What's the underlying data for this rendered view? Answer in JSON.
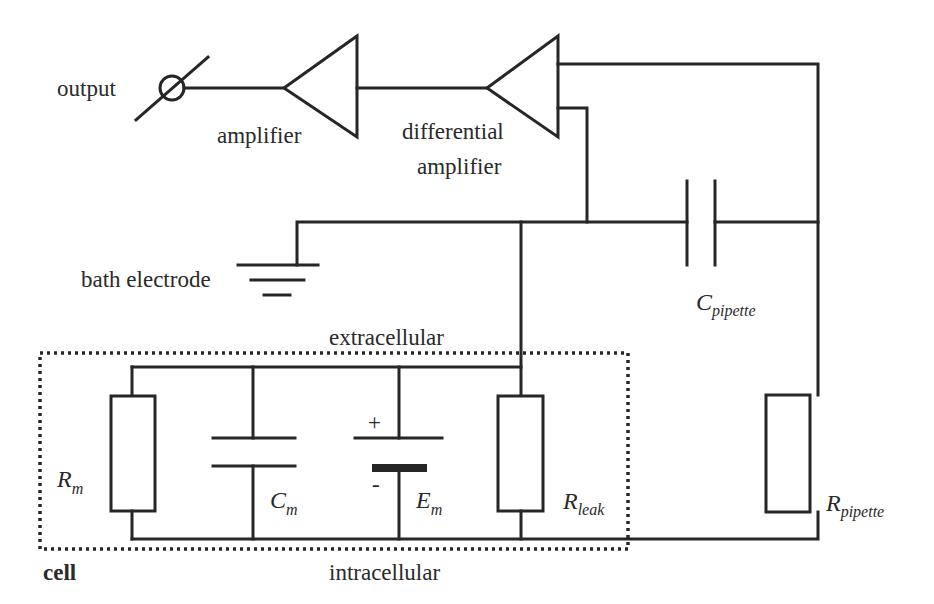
{
  "diagram": {
    "labels": {
      "output": "output",
      "amplifier": "amplifier",
      "differential_amplifier_line1": "differential",
      "differential_amplifier_line2": "amplifier",
      "bath_electrode": "bath electrode",
      "extracellular": "extracellular",
      "intracellular": "intracellular",
      "cell": "cell",
      "plus_sign": "+",
      "minus_sign": "-"
    },
    "components": {
      "c_pipette": {
        "symbol": "C",
        "subscript": "pipette"
      },
      "r_pipette": {
        "symbol": "R",
        "subscript": "pipette"
      },
      "r_m": {
        "symbol": "R",
        "subscript": "m"
      },
      "c_m": {
        "symbol": "C",
        "subscript": "m"
      },
      "e_m": {
        "symbol": "E",
        "subscript": "m"
      },
      "r_leak": {
        "symbol": "R",
        "subscript": "leak"
      }
    },
    "colors": {
      "line": "#262626",
      "text": "#2a2a2a",
      "background": "#ffffff"
    }
  }
}
